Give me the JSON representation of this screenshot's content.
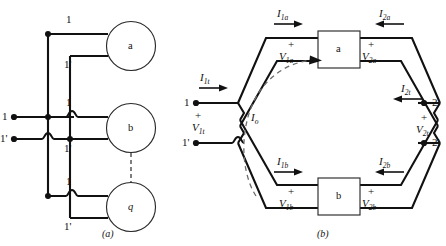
{
  "figure": {
    "captions": {
      "left": "(a)",
      "right": "(b)"
    }
  },
  "diagram_a": {
    "name": "parallel-connection-of-q-two-ports",
    "terminals": {
      "input_top": "1",
      "input_bottom": "1'"
    },
    "branch_labels": [
      {
        "top": "1",
        "bottom": "1'"
      },
      {
        "top": "1",
        "bottom": "1'"
      },
      {
        "top": "1",
        "bottom": "1'"
      }
    ],
    "elements": [
      {
        "id": "element-a",
        "label": "a"
      },
      {
        "id": "element-b",
        "label": "b"
      },
      {
        "id": "element-q",
        "label": "q"
      }
    ],
    "ellipsis_note": "dashed vertical link between b and q indicating continuation"
  },
  "diagram_b": {
    "name": "series-series-interconnection-two-ports",
    "left_terminals": {
      "top": "1",
      "bottom": "1'",
      "polarity": "+",
      "voltage": "V1t",
      "voltage_main": "V",
      "voltage_sub": "1t",
      "current": "I1t",
      "current_main": "I",
      "current_sub": "1t",
      "current_direction": "right"
    },
    "right_terminals": {
      "top": "2",
      "bottom": "2'",
      "polarity": "+",
      "voltage": "V2t",
      "voltage_main": "V",
      "voltage_sub": "2t",
      "current": "I2t",
      "current_main": "I",
      "current_sub": "2t",
      "current_direction": "left"
    },
    "blocks": [
      {
        "id": "block-a",
        "label": "a",
        "left_current": {
          "main": "I",
          "sub": "1a",
          "direction": "right"
        },
        "right_current": {
          "main": "I",
          "sub": "2a",
          "direction": "left"
        },
        "left_voltage": {
          "polarity": "+",
          "main": "V",
          "sub": "1a"
        },
        "right_voltage": {
          "polarity": "+",
          "main": "V",
          "sub": "2a"
        }
      },
      {
        "id": "block-b",
        "label": "b",
        "left_current": {
          "main": "I",
          "sub": "1b",
          "direction": "right"
        },
        "right_current": {
          "main": "I",
          "sub": "2b",
          "direction": "left"
        },
        "left_voltage": {
          "polarity": "+",
          "main": "V",
          "sub": "1b"
        },
        "right_voltage": {
          "polarity": "+",
          "main": "V",
          "sub": "2b"
        }
      }
    ],
    "circulating_current": {
      "main": "I",
      "sub": "o",
      "label": "Io",
      "style": "dashed-arc-clockwise"
    }
  },
  "colors": {
    "wire": "#111111",
    "outline": "#2a2a2a",
    "dashed": "#6b6b6b",
    "background": "#ffffff"
  }
}
